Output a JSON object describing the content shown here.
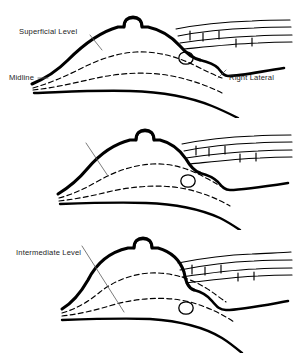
{
  "figure": {
    "background_color": "#ffffff",
    "ink_color": "#000000",
    "text_color": "#1c1c1c",
    "panel_count": 3
  },
  "orientation": {
    "left_label": "Midline",
    "right_label": "Right Lateral"
  },
  "panels": [
    {
      "id": "superficial",
      "label": "Superficial Level",
      "order": 1,
      "leader_line": "short",
      "depth_rank": 1,
      "features": {
        "dome_outline": "thick solid contour with apical nipple projection",
        "dashed_planes": 2,
        "nodule": "small oval node lateral to dome",
        "lateral_bands": 3,
        "base_line": "solid chest wall curve"
      }
    },
    {
      "id": "intermediate",
      "label": "Intermediate Level",
      "order": 2,
      "leader_line": "medium",
      "depth_rank": 2,
      "features": {
        "dome_outline": "thick solid contour with apical nipple projection",
        "dashed_planes": 2,
        "nodule": "small oval node lateral to dome",
        "lateral_bands": 3,
        "base_line": "solid chest wall curve"
      }
    },
    {
      "id": "deep",
      "label": "Deep Level",
      "order": 3,
      "leader_line": "long",
      "depth_rank": 3,
      "features": {
        "dome_outline": "thick solid contour with apical nipple projection",
        "dashed_planes": 2,
        "nodule": "small oval node lateral to dome",
        "lateral_bands": 3,
        "base_line": "solid chest wall curve"
      }
    }
  ]
}
